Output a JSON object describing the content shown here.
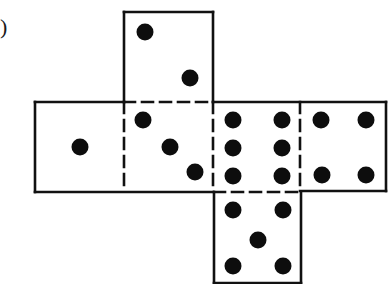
{
  "figure": {
    "label": ")",
    "line_color": "#111111",
    "dot_color": "#0d0d0d",
    "background": "#ffffff"
  },
  "faces": [
    {
      "name": "top-face",
      "value": 2,
      "x": 124,
      "y": 12,
      "w": 89,
      "h": 90,
      "dots": [
        [
          145,
          32
        ],
        [
          190,
          78
        ]
      ]
    },
    {
      "name": "left-face",
      "value": 1,
      "x": 35,
      "y": 102,
      "w": 89,
      "h": 90,
      "dots": [
        [
          80,
          147
        ]
      ]
    },
    {
      "name": "center-face",
      "value": 3,
      "x": 124,
      "y": 102,
      "w": 89,
      "h": 90,
      "dots": [
        [
          143,
          120
        ],
        [
          170,
          147
        ],
        [
          195,
          172
        ]
      ]
    },
    {
      "name": "six-face",
      "value": 6,
      "x": 213,
      "y": 102,
      "w": 87,
      "h": 90,
      "dots": [
        [
          233,
          120
        ],
        [
          282,
          120
        ],
        [
          233,
          148
        ],
        [
          282,
          148
        ],
        [
          233,
          176
        ],
        [
          282,
          176
        ]
      ]
    },
    {
      "name": "right-face",
      "value": 4,
      "x": 300,
      "y": 102,
      "w": 86,
      "h": 89,
      "dots": [
        [
          321,
          120
        ],
        [
          366,
          120
        ],
        [
          322,
          175
        ],
        [
          366,
          175
        ]
      ]
    },
    {
      "name": "bottom-face",
      "value": 5,
      "x": 214,
      "y": 192,
      "w": 87,
      "h": 91,
      "dots": [
        [
          233,
          210
        ],
        [
          283,
          210
        ],
        [
          258,
          240
        ],
        [
          233,
          266
        ],
        [
          283,
          266
        ]
      ]
    }
  ],
  "solid_lines": [
    [
      124,
      12,
      213,
      12
    ],
    [
      124,
      12,
      124,
      102
    ],
    [
      213,
      12,
      213,
      102
    ],
    [
      35,
      102,
      124,
      102
    ],
    [
      213,
      102,
      386,
      102
    ],
    [
      35,
      102,
      35,
      192
    ],
    [
      386,
      102,
      386,
      191
    ],
    [
      35,
      192,
      213,
      192
    ],
    [
      300,
      191,
      386,
      191
    ],
    [
      214,
      192,
      214,
      283
    ],
    [
      301,
      192,
      301,
      283
    ],
    [
      214,
      283,
      301,
      283
    ]
  ],
  "dashed_lines": [
    [
      124,
      102,
      213,
      102
    ],
    [
      124,
      102,
      124,
      192
    ],
    [
      213,
      102,
      213,
      192
    ],
    [
      300,
      102,
      300,
      191
    ],
    [
      214,
      192,
      301,
      192
    ]
  ]
}
